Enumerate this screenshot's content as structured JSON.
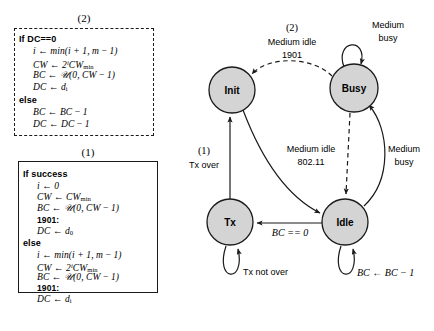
{
  "figure": {
    "panels": [
      {
        "id": "panel-2",
        "label": "(2)",
        "border": "dashed",
        "lines": [
          {
            "kind": "keyword",
            "text": "If DC==0"
          },
          {
            "kind": "math",
            "text": "i ← min(i + 1, m − 1)"
          },
          {
            "kind": "math",
            "text": "CW ← 2ⁱCWₘᵢₙ"
          },
          {
            "kind": "math",
            "text": "BC ← 𝒰(0, CW − 1)"
          },
          {
            "kind": "math",
            "text": "DC ← dᵢ"
          },
          {
            "kind": "keyword",
            "text": "else"
          },
          {
            "kind": "math",
            "text": "BC ← BC − 1"
          },
          {
            "kind": "math",
            "text": "DC ← DC − 1"
          }
        ]
      },
      {
        "id": "panel-1",
        "label": "(1)",
        "border": "solid",
        "lines": [
          {
            "kind": "keyword",
            "text": "If success"
          },
          {
            "kind": "math",
            "text": "i ← 0"
          },
          {
            "kind": "math",
            "text": "CW ← CWₘᵢₙ"
          },
          {
            "kind": "math",
            "text": "BC ← 𝒰(0, CW − 1)"
          },
          {
            "kind": "label",
            "text": "1901:"
          },
          {
            "kind": "math",
            "text": "DC ← d₀"
          },
          {
            "kind": "keyword",
            "text": "else"
          },
          {
            "kind": "math",
            "text": "i ← min(i + 1, m − 1)"
          },
          {
            "kind": "math",
            "text": "CW ← 2ⁱCWₘᵢₙ"
          },
          {
            "kind": "math",
            "text": "BC ← 𝒰(0, CW − 1)"
          },
          {
            "kind": "label",
            "text": "1901:"
          },
          {
            "kind": "math",
            "text": "DC ← dᵢ"
          }
        ]
      }
    ],
    "state_machine": {
      "states": [
        {
          "id": "init",
          "label": "Init"
        },
        {
          "id": "busy",
          "label": "Busy"
        },
        {
          "id": "tx",
          "label": "Tx"
        },
        {
          "id": "idle",
          "label": "Idle"
        }
      ],
      "transitions": [
        {
          "id": "busy-to-init",
          "from": "Busy",
          "to": "Init",
          "style": "dashed",
          "index": "(2)",
          "label_line1": "Medium idle",
          "label_line2": "1901"
        },
        {
          "id": "busy-self",
          "from": "Busy",
          "to": "Busy",
          "style": "solid",
          "label_line1": "Medium",
          "label_line2": "busy"
        },
        {
          "id": "busy-to-idle",
          "from": "Busy",
          "to": "Idle",
          "style": "dashed",
          "label_line1": "Medium idle",
          "label_line2": "802.11"
        },
        {
          "id": "idle-to-busy",
          "from": "Idle",
          "to": "Busy",
          "style": "solid",
          "label_line1": "Medium",
          "label_line2": "busy"
        },
        {
          "id": "tx-to-init",
          "from": "Tx",
          "to": "Init",
          "style": "solid",
          "index": "(1)",
          "label_line1": "Tx over"
        },
        {
          "id": "init-to-idle",
          "from": "Init",
          "to": "Idle",
          "style": "solid",
          "label_line1": ""
        },
        {
          "id": "idle-to-tx",
          "from": "Idle",
          "to": "Tx",
          "style": "solid",
          "label_line1": "BC == 0"
        },
        {
          "id": "tx-self",
          "from": "Tx",
          "to": "Tx",
          "style": "solid",
          "label_line1": "Tx not over"
        },
        {
          "id": "idle-self",
          "from": "Idle",
          "to": "Idle",
          "style": "solid",
          "label_line1": "BC ← BC − 1"
        }
      ]
    },
    "colors": {
      "node_fill": "#d4d4d4",
      "stroke": "#1a1a1a",
      "background": "#ffffff"
    }
  }
}
